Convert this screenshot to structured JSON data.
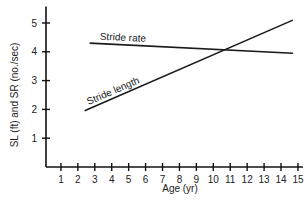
{
  "chart_data": {
    "type": "line",
    "title": "",
    "xlabel": "Age (yr)",
    "ylabel": "SL (ft) and SR (no./sec)",
    "xlim": [
      0,
      15.3
    ],
    "ylim": [
      0,
      5.5
    ],
    "x_ticks": [
      1,
      2,
      3,
      4,
      5,
      6,
      7,
      8,
      9,
      10,
      11,
      12,
      13,
      14,
      15
    ],
    "y_ticks": [
      1,
      2,
      3,
      4,
      5
    ],
    "grid": false,
    "legend": "none (inline labels on lines)",
    "series": [
      {
        "name": "Stride rate",
        "x": [
          2.7,
          14.7
        ],
        "y": [
          4.3,
          3.95
        ]
      },
      {
        "name": "Stride length",
        "x": [
          2.4,
          14.7
        ],
        "y": [
          1.95,
          5.1
        ]
      }
    ]
  }
}
